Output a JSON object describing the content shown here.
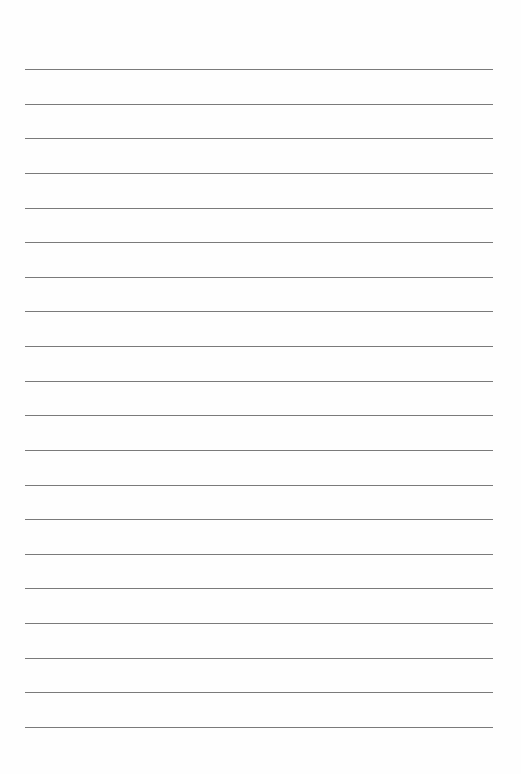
{
  "page": {
    "type": "lined-paper",
    "line_count": 20,
    "line_color": "#7a7a7a",
    "background": "#fefefe"
  }
}
